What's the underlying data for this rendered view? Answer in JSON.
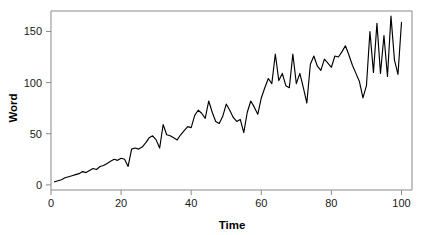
{
  "chart_data": {
    "type": "line",
    "title": "",
    "subtitle": "",
    "xlabel": "Time",
    "ylabel": "Word",
    "xlim": [
      0,
      103
    ],
    "ylim": [
      -5,
      170
    ],
    "xticks": [
      0,
      20,
      40,
      60,
      80,
      100
    ],
    "xtick_labels": [
      "0",
      "20",
      "40",
      "60",
      "80",
      "100"
    ],
    "yticks": [
      0,
      50,
      100,
      150
    ],
    "ytick_labels": [
      "0",
      "50",
      "100",
      "150"
    ],
    "grid": false,
    "legend": false,
    "legend_position": "none",
    "line_color": "#000000",
    "frame_color": "#8a8a8a",
    "background_color": "#ffffff",
    "series": [
      {
        "name": "Word",
        "x": [
          1,
          2,
          3,
          4,
          5,
          6,
          7,
          8,
          9,
          10,
          11,
          12,
          13,
          14,
          15,
          16,
          17,
          18,
          19,
          20,
          21,
          22,
          23,
          24,
          25,
          26,
          27,
          28,
          29,
          30,
          31,
          32,
          33,
          34,
          35,
          36,
          37,
          38,
          39,
          40,
          41,
          42,
          43,
          44,
          45,
          46,
          47,
          48,
          49,
          50,
          51,
          52,
          53,
          54,
          55,
          56,
          57,
          58,
          59,
          60,
          61,
          62,
          63,
          64,
          65,
          66,
          67,
          68,
          69,
          70,
          71,
          72,
          73,
          74,
          75,
          76,
          77,
          78,
          79,
          80,
          81,
          82,
          83,
          84,
          85,
          86,
          87,
          88,
          89,
          90,
          91,
          92,
          93,
          94,
          95,
          96,
          97,
          98,
          99,
          100
        ],
        "values": [
          3,
          4,
          5,
          7,
          8,
          9,
          10,
          11,
          13,
          12,
          14,
          16,
          15,
          18,
          19,
          21,
          23,
          25,
          24,
          26,
          25,
          18,
          35,
          36,
          35,
          37,
          41,
          46,
          48,
          44,
          36,
          59,
          49,
          48,
          46,
          44,
          49,
          53,
          57,
          56,
          68,
          73,
          70,
          65,
          82,
          71,
          62,
          60,
          67,
          79,
          73,
          66,
          62,
          64,
          51,
          71,
          82,
          76,
          69,
          85,
          95,
          104,
          99,
          128,
          102,
          109,
          97,
          95,
          128,
          99,
          109,
          95,
          80,
          118,
          126,
          116,
          112,
          123,
          119,
          115,
          126,
          125,
          130,
          136,
          127,
          117,
          109,
          101,
          85,
          97,
          150,
          110,
          158,
          109,
          146,
          106,
          165,
          122,
          108,
          159
        ]
      }
    ]
  },
  "axis": {
    "y_title": "Word",
    "x_title": "Time"
  }
}
